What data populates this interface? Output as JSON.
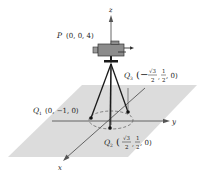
{
  "diagram": {
    "colors": {
      "plane": "#d9d9d9",
      "axis": "#555555",
      "tripod": "#1a1a1a",
      "camera_body": "#8c8c8c",
      "dashed_circle": "#666666"
    },
    "axes": {
      "x_label": "x",
      "y_label": "y",
      "z_label": "z"
    },
    "points": {
      "P": {
        "name": "P",
        "coords": "(0, 0, 4)"
      },
      "Q1": {
        "name": "Q",
        "sub": "1",
        "coords": "(0, −1, 0)"
      },
      "Q2": {
        "name": "Q",
        "sub": "2",
        "open": "(",
        "frac1_num": "√3",
        "frac1_den": "2",
        "sep1": ",",
        "frac2_num": "1",
        "frac2_den": "2",
        "tail": ", 0)"
      },
      "Q3": {
        "name": "Q",
        "sub": "3",
        "open": "(−",
        "frac1_num": "√3",
        "frac1_den": "2",
        "sep1": ",",
        "frac2_num": "1",
        "frac2_den": "2",
        "tail": ", 0)"
      }
    }
  }
}
